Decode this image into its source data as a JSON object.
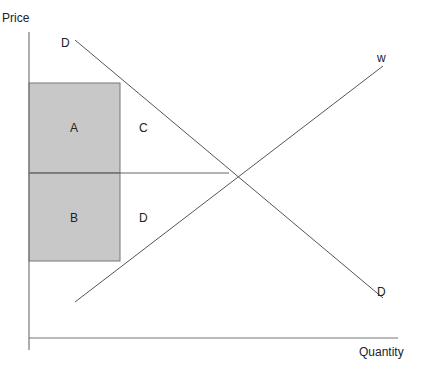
{
  "diagram": {
    "title": "",
    "axes": {
      "y_label": "Price",
      "x_label": "Quantity"
    },
    "curves": [
      {
        "name": "demand",
        "label_start": "D",
        "label_end": "D"
      },
      {
        "name": "supply",
        "label": "w"
      }
    ],
    "regions": [
      {
        "label": "A",
        "shaded": true
      },
      {
        "label": "B",
        "shaded": true
      },
      {
        "label": "C",
        "shaded": false
      },
      {
        "label": "D",
        "shaded": false
      }
    ],
    "colors": {
      "line": "#555555",
      "fill": "#c8c8c8"
    }
  }
}
